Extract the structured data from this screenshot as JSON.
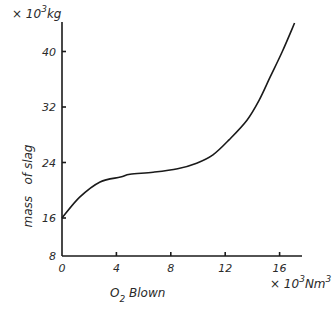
{
  "chart_data": {
    "type": "line",
    "title": "",
    "xlabel": "O2 Blown",
    "xlabel_main": "O",
    "xlabel_sub": "2",
    "xlabel_rest": " Blown",
    "xunit": "× 10³Nm³",
    "xunit_prefix": "× 10",
    "xunit_sup1": "3",
    "xunit_mid": "Nm",
    "xunit_sup2": "3",
    "ylabel": "mass   of slag",
    "yunit": "× 10³kg",
    "yunit_prefix": "× 10",
    "yunit_sup": "3",
    "yunit_mid": "kg",
    "xlim": [
      0,
      17.5
    ],
    "ylim": [
      8,
      45
    ],
    "y_axis_break": "axis starts at 8 with compressed gap below 16",
    "x_ticks": [
      0,
      4,
      8,
      12,
      16
    ],
    "x_tick_labels": [
      "0",
      "4",
      "8",
      "12",
      "16"
    ],
    "y_ticks": [
      8,
      16,
      24,
      32,
      40
    ],
    "y_tick_labels": [
      "8",
      "16",
      "24",
      "32",
      "40"
    ],
    "grid": false,
    "legend": "none",
    "series": [
      {
        "name": "mass of slag",
        "x": [
          0,
          1.3,
          2.8,
          4.3,
          5.0,
          6.7,
          8.5,
          9.9,
          11.1,
          12.3,
          13.6,
          14.5,
          15.3,
          16.2,
          17.1
        ],
        "y": [
          16.0,
          19.0,
          21.2,
          21.9,
          22.3,
          22.6,
          23.1,
          23.9,
          25.1,
          27.3,
          30.1,
          33.0,
          36.3,
          40.0,
          44.1
        ]
      }
    ]
  }
}
